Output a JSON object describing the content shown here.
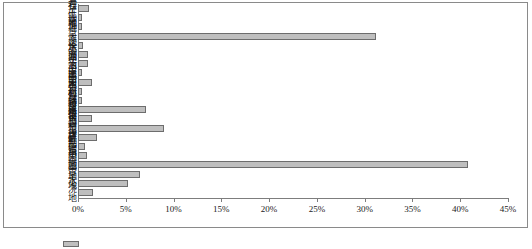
{
  "figure": {
    "frame_border_color": "#8a8a8a",
    "bar_fill": "#bfbfbf",
    "bar_stroke": "#6d6d6d",
    "legend_label": ""
  },
  "chart_data": {
    "type": "bar",
    "orientation": "horizontal",
    "title": "",
    "xlabel": "",
    "ylabel": "",
    "xlim": [
      0,
      45
    ],
    "grid": false,
    "legend_position": "bottom-left",
    "xticks": [
      "0%",
      "5%",
      "10%",
      "15%",
      "20%",
      "25%",
      "30%",
      "35%",
      "40%",
      "45%"
    ],
    "xtick_values": [
      0,
      5,
      10,
      15,
      20,
      25,
      30,
      35,
      40,
      45
    ],
    "categories": [
      "裸岩石砾地",
      "裸土地",
      "沙地",
      "荒草地",
      "滩涂",
      "水面",
      "坑塘水面",
      "湖泊水面",
      "河流水面",
      "民用机场",
      "农村道路",
      "公路用地",
      "特殊用地",
      "独立工矿",
      "农村居民点",
      "建制镇",
      "其他园地",
      "果园",
      "菜地",
      "旱地",
      "水浇地"
    ],
    "values": [
      1.1,
      0.15,
      0.1,
      31.2,
      0.5,
      1.0,
      1.0,
      0.3,
      1.5,
      0.35,
      0.2,
      7.1,
      1.5,
      9.0,
      2.0,
      0.7,
      0.9,
      40.8,
      6.5,
      5.2,
      1.6
    ],
    "series": [
      {
        "name": "",
        "values": [
          1.1,
          0.15,
          0.1,
          31.2,
          0.5,
          1.0,
          1.0,
          0.3,
          1.5,
          0.35,
          0.2,
          7.1,
          1.5,
          9.0,
          2.0,
          0.7,
          0.9,
          40.8,
          6.5,
          5.2,
          1.6
        ]
      }
    ]
  }
}
